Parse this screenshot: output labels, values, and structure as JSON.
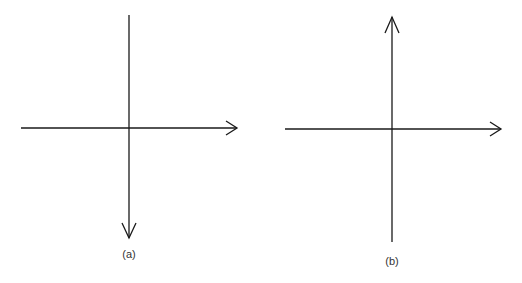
{
  "figures": [
    {
      "label": "(a)",
      "origin": [
        129,
        128
      ],
      "x_axis": {
        "from": 21,
        "to": 237,
        "arrow": "right"
      },
      "y_axis": {
        "from": 15,
        "to": 238,
        "arrow": "down"
      },
      "label_pos": [
        129,
        248
      ]
    },
    {
      "label": "(b)",
      "origin": [
        392,
        129
      ],
      "x_axis": {
        "from": 285,
        "to": 501,
        "arrow": "right"
      },
      "y_axis": {
        "from": 17,
        "to": 242,
        "arrow": "up"
      },
      "label_pos": [
        392,
        255
      ]
    }
  ],
  "colors": {
    "stroke": "#1a1a1a",
    "background": "#ffffff",
    "label": "#333333"
  }
}
